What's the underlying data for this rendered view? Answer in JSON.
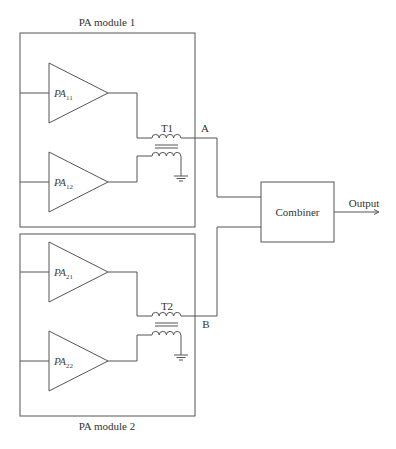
{
  "diagram": {
    "modules": [
      {
        "label": "PA module 1",
        "amplifiers": [
          {
            "prefix": "PA",
            "subscript": "11"
          },
          {
            "prefix": "PA",
            "subscript": "12"
          }
        ],
        "transformer": "T1",
        "node": "A"
      },
      {
        "label": "PA module 2",
        "amplifiers": [
          {
            "prefix": "PA",
            "subscript": "21"
          },
          {
            "prefix": "PA",
            "subscript": "22"
          }
        ],
        "transformer": "T2",
        "node": "B"
      }
    ],
    "combiner": {
      "label": "Combiner"
    },
    "output": {
      "label": "Output"
    },
    "colors": {
      "stroke": "#555555",
      "text": "#333333",
      "background": "#ffffff"
    }
  }
}
